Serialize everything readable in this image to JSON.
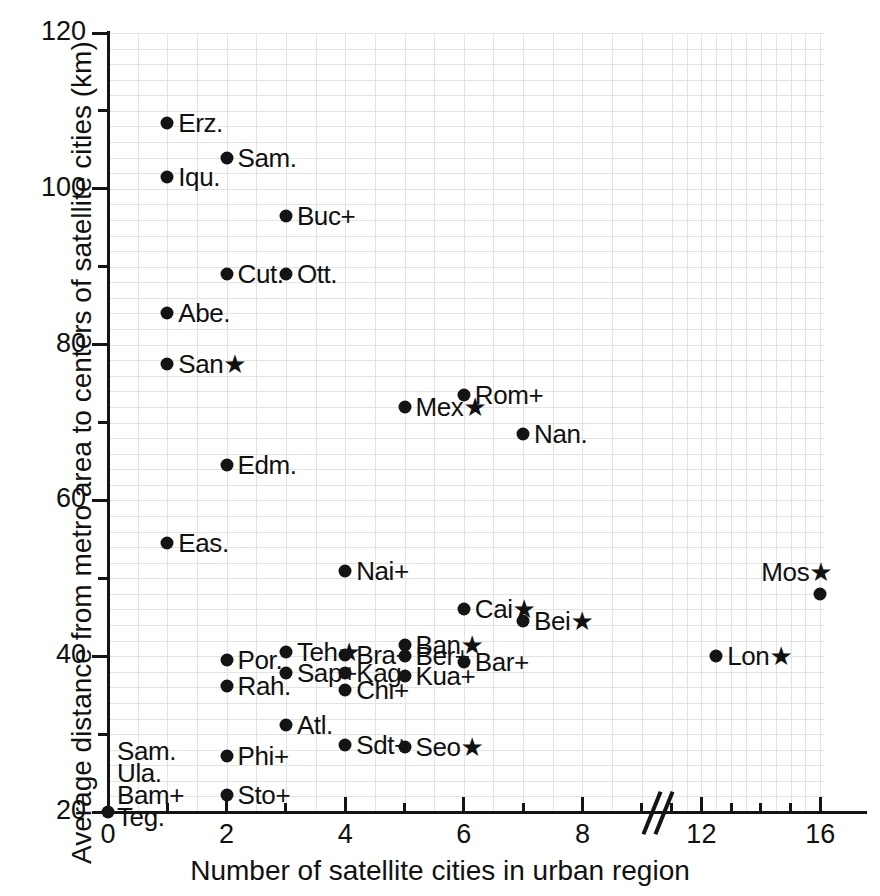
{
  "chart_data": {
    "type": "scatter",
    "title": "",
    "xlabel": "Number of satellite cities in urban region",
    "ylabel": "Average distance from metro area to centers of satellite cities (km)",
    "xlim": [
      0,
      17
    ],
    "ylim": [
      20,
      120
    ],
    "x_axis_break": {
      "present": true,
      "between": [
        9,
        11
      ],
      "note": "// break mark drawn on x axis between 9 and 11"
    },
    "x_major_ticks": [
      0,
      2,
      4,
      6,
      8,
      12,
      16
    ],
    "x_major_tick_labels": [
      "0",
      "2",
      "4",
      "6",
      "8",
      "12",
      "16"
    ],
    "x_minor_ticks": [
      1,
      3,
      5,
      7,
      9,
      11,
      13,
      14,
      15
    ],
    "y_major_ticks": [
      20,
      40,
      60,
      80,
      100,
      120
    ],
    "y_major_tick_labels": [
      "20",
      "40",
      "60",
      "80",
      "100",
      "120"
    ],
    "y_minor_ticks": [
      30,
      50,
      70,
      90,
      110
    ],
    "grid": {
      "x": true,
      "y": true,
      "color": "#e3e3e3",
      "x_step": 0.5,
      "y_step": 2
    },
    "marker": {
      "shape": "circle",
      "color": "#141414",
      "size_px": 13
    },
    "legend": {
      "present": false
    },
    "points": [
      {
        "label": "Erz",
        "suffix": ".",
        "x": 1,
        "y": 108.5,
        "label_side": "right"
      },
      {
        "label": "Sam",
        "suffix": ".",
        "x": 2,
        "y": 104.0,
        "label_side": "right"
      },
      {
        "label": "Iqu",
        "suffix": ".",
        "x": 1,
        "y": 101.5,
        "label_side": "right"
      },
      {
        "label": "Buc",
        "suffix": "+",
        "x": 3,
        "y": 96.5,
        "label_side": "right"
      },
      {
        "label": "Cut",
        "suffix": ".",
        "x": 2,
        "y": 89.0,
        "label_side": "right"
      },
      {
        "label": "Ott",
        "suffix": ".",
        "x": 3,
        "y": 89.0,
        "label_side": "right"
      },
      {
        "label": "Abe",
        "suffix": ".",
        "x": 1,
        "y": 84.0,
        "label_side": "right"
      },
      {
        "label": "San",
        "suffix": "★",
        "x": 1,
        "y": 77.5,
        "label_side": "right"
      },
      {
        "label": "Rom",
        "suffix": "+",
        "x": 6,
        "y": 73.5,
        "label_side": "right"
      },
      {
        "label": "Mex",
        "suffix": "★",
        "x": 5,
        "y": 72.0,
        "label_side": "right"
      },
      {
        "label": "Nan",
        "suffix": ".",
        "x": 7,
        "y": 68.5,
        "label_side": "right"
      },
      {
        "label": "Edm",
        "suffix": ".",
        "x": 2,
        "y": 64.5,
        "label_side": "right"
      },
      {
        "label": "Eas",
        "suffix": ".",
        "x": 1,
        "y": 54.5,
        "label_side": "right"
      },
      {
        "label": "Nai",
        "suffix": "+",
        "x": 4,
        "y": 51.0,
        "label_side": "right"
      },
      {
        "label": "Mos",
        "suffix": "★",
        "x": 16,
        "y": 48.0,
        "label_side": "above-left"
      },
      {
        "label": "Cai",
        "suffix": "★",
        "x": 6,
        "y": 46.0,
        "label_side": "right"
      },
      {
        "label": "Bei",
        "suffix": "★",
        "x": 7,
        "y": 44.5,
        "label_side": "right"
      },
      {
        "label": "Ban",
        "suffix": "★",
        "x": 5,
        "y": 41.5,
        "label_side": "right"
      },
      {
        "label": "Teh",
        "suffix": "★",
        "x": 3,
        "y": 40.5,
        "label_side": "right"
      },
      {
        "label": "Bra",
        "suffix": "+",
        "x": 4,
        "y": 40.2,
        "label_side": "right"
      },
      {
        "label": "Ber",
        "suffix": "+",
        "x": 5,
        "y": 40.0,
        "label_side": "right"
      },
      {
        "label": "Lon",
        "suffix": "★",
        "x": 12.5,
        "y": 40.0,
        "label_side": "right"
      },
      {
        "label": "Por",
        "suffix": ".",
        "x": 2,
        "y": 39.5,
        "label_side": "right"
      },
      {
        "label": "Bar",
        "suffix": "+",
        "x": 6,
        "y": 39.2,
        "label_side": "right"
      },
      {
        "label": "Sap",
        "suffix": "+",
        "x": 3,
        "y": 37.8,
        "label_side": "right"
      },
      {
        "label": "Kag",
        "suffix": ".",
        "x": 4,
        "y": 37.8,
        "label_side": "right"
      },
      {
        "label": "Kua",
        "suffix": "+",
        "x": 5,
        "y": 37.5,
        "label_side": "right"
      },
      {
        "label": "Rah",
        "suffix": ".",
        "x": 2,
        "y": 36.2,
        "label_side": "right"
      },
      {
        "label": "Chi",
        "suffix": "+",
        "x": 4,
        "y": 35.6,
        "label_side": "right"
      },
      {
        "label": "Atl",
        "suffix": ".",
        "x": 3,
        "y": 31.2,
        "label_side": "right"
      },
      {
        "label": "Sdt",
        "suffix": "+",
        "x": 4,
        "y": 28.6,
        "label_side": "right"
      },
      {
        "label": "Seo",
        "suffix": "★",
        "x": 5,
        "y": 28.4,
        "label_side": "right"
      },
      {
        "label": "Phi",
        "suffix": "+",
        "x": 2,
        "y": 27.2,
        "label_side": "right"
      },
      {
        "label": "Sto",
        "suffix": "+",
        "x": 2,
        "y": 22.2,
        "label_side": "right"
      }
    ],
    "origin_stack": {
      "x": 0,
      "y": 20,
      "labels": [
        {
          "label": "Sam",
          "suffix": "."
        },
        {
          "label": "Ula",
          "suffix": "."
        },
        {
          "label": "Bam",
          "suffix": "+"
        },
        {
          "label": "Teg",
          "suffix": "."
        }
      ]
    }
  }
}
